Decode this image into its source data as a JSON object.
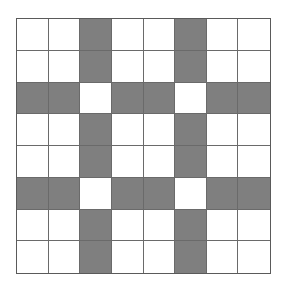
{
  "diagram": {
    "type": "grid",
    "rows": 8,
    "cols": 8,
    "shaded_color": "#7f7f7f",
    "empty_color": "#ffffff",
    "line_color": "#6a6a6a",
    "cells": [
      [
        0,
        0,
        1,
        0,
        0,
        1,
        0,
        0
      ],
      [
        0,
        0,
        1,
        0,
        0,
        1,
        0,
        0
      ],
      [
        1,
        1,
        0,
        1,
        1,
        0,
        1,
        1
      ],
      [
        0,
        0,
        1,
        0,
        0,
        1,
        0,
        0
      ],
      [
        0,
        0,
        1,
        0,
        0,
        1,
        0,
        0
      ],
      [
        1,
        1,
        0,
        1,
        1,
        0,
        1,
        1
      ],
      [
        0,
        0,
        1,
        0,
        0,
        1,
        0,
        0
      ],
      [
        0,
        0,
        1,
        0,
        0,
        1,
        0,
        0
      ]
    ]
  }
}
